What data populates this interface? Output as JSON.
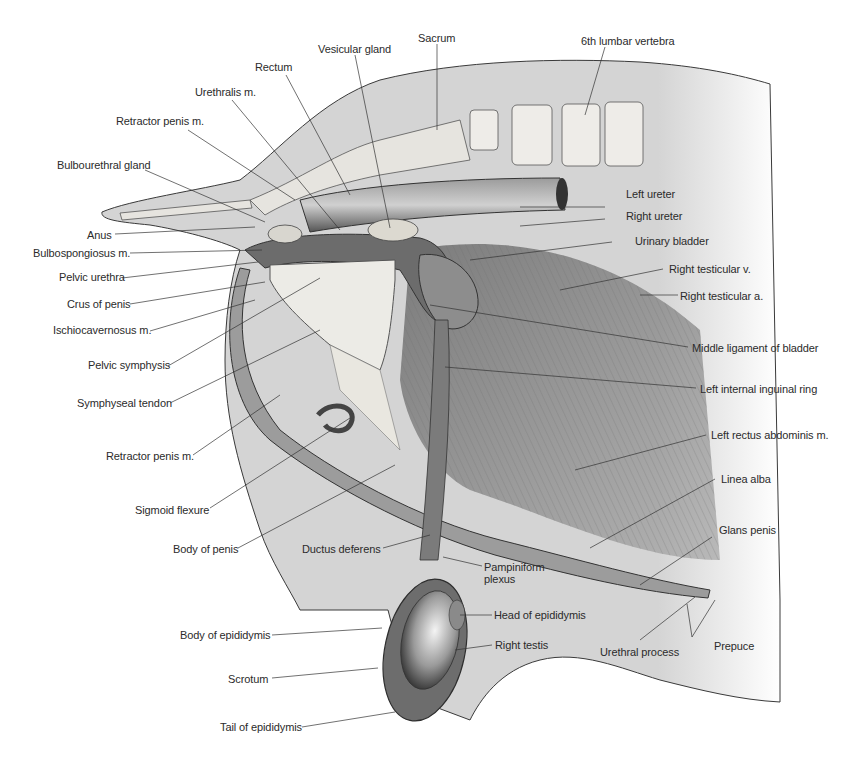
{
  "figure": {
    "colors": {
      "background": "#ffffff",
      "body_fill": "#d4d4d4",
      "outline": "#3a3a3a",
      "muscle": "#7a7a7a",
      "bone": "#e6e4df",
      "leader_line": "#333333",
      "label_text": "#2b2b2b"
    }
  },
  "labels": {
    "top": [
      {
        "id": "sacrum",
        "text": "Sacrum"
      },
      {
        "id": "vesicular_gland",
        "text": "Vesicular gland"
      },
      {
        "id": "rectum",
        "text": "Rectum"
      },
      {
        "id": "urethralis",
        "text": "Urethralis m."
      },
      {
        "id": "lumbar_vertebra",
        "text": "6th lumbar vertebra"
      }
    ],
    "left": [
      {
        "id": "retractor_penis_upper",
        "text": "Retractor penis m."
      },
      {
        "id": "bulbourethral_gland",
        "text": "Bulbourethral gland"
      },
      {
        "id": "anus",
        "text": "Anus"
      },
      {
        "id": "bulbospongiosus",
        "text": "Bulbospongiosus m."
      },
      {
        "id": "pelvic_urethra",
        "text": "Pelvic urethra"
      },
      {
        "id": "crus_of_penis",
        "text": "Crus of penis"
      },
      {
        "id": "ischiocavernosus",
        "text": "Ischiocavernosus m."
      },
      {
        "id": "pelvic_symphysis",
        "text": "Pelvic symphysis"
      },
      {
        "id": "symphyseal_tendon",
        "text": "Symphyseal tendon"
      },
      {
        "id": "retractor_penis_lower",
        "text": "Retractor penis m."
      },
      {
        "id": "sigmoid_flexure",
        "text": "Sigmoid flexure"
      },
      {
        "id": "body_of_penis",
        "text": "Body of penis"
      },
      {
        "id": "body_of_epididymis",
        "text": "Body of epididymis"
      },
      {
        "id": "scrotum",
        "text": "Scrotum"
      },
      {
        "id": "tail_of_epididymis",
        "text": "Tail of epididymis"
      }
    ],
    "right": [
      {
        "id": "left_ureter",
        "text": "Left ureter"
      },
      {
        "id": "right_ureter",
        "text": "Right ureter"
      },
      {
        "id": "urinary_bladder",
        "text": "Urinary bladder"
      },
      {
        "id": "right_testicular_v",
        "text": "Right testicular v."
      },
      {
        "id": "right_testicular_a",
        "text": "Right testicular a."
      },
      {
        "id": "middle_ligament",
        "text": "Middle ligament of bladder"
      },
      {
        "id": "left_internal_inguinal_ring",
        "text": "Left internal inguinal ring"
      },
      {
        "id": "left_rectus_abdominis",
        "text": "Left rectus abdominis m."
      },
      {
        "id": "linea_alba",
        "text": "Linea alba"
      },
      {
        "id": "glans_penis",
        "text": "Glans penis"
      }
    ],
    "bottom": [
      {
        "id": "ductus_deferens",
        "text": "Ductus deferens"
      },
      {
        "id": "pampiniform_line1",
        "text": "Pampiniform"
      },
      {
        "id": "pampiniform_line2",
        "text": "plexus"
      },
      {
        "id": "head_of_epididymis",
        "text": "Head of epididymis"
      },
      {
        "id": "right_testis",
        "text": "Right testis"
      },
      {
        "id": "urethral_process",
        "text": "Urethral process"
      },
      {
        "id": "prepuce",
        "text": "Prepuce"
      }
    ]
  }
}
